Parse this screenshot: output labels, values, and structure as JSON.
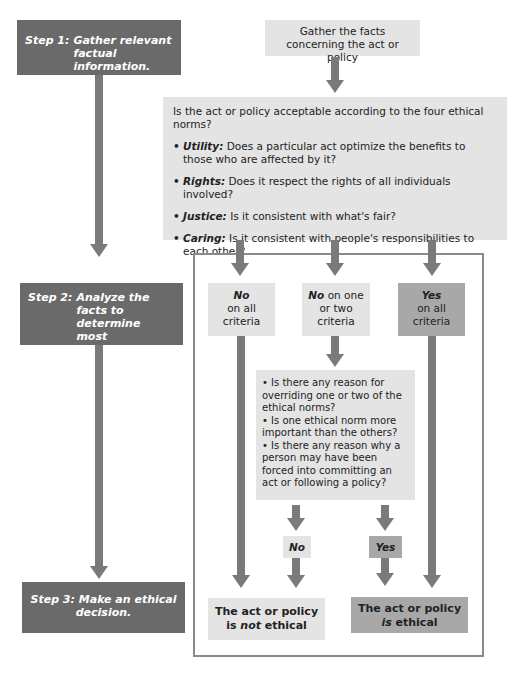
{
  "steps": [
    {
      "prefix": "Step 1:",
      "text": "Gather relevant factual information."
    },
    {
      "prefix": "Step 2:",
      "text": "Analyze the facts to determine most appropriate moral values."
    },
    {
      "prefix": "Step 3:",
      "text": "Make an ethical decision."
    }
  ],
  "gather_box": {
    "text": "Gather the facts concerning the act or policy"
  },
  "question_box": {
    "question": "Is the act or policy acceptable according to the four ethical norms?",
    "norms": [
      {
        "name": "Utility:",
        "text": "Does a particular act optimize the benefits to those who are affected by it?"
      },
      {
        "name": "Rights:",
        "text": "Does it respect the rights of all individuals involved?"
      },
      {
        "name": "Justice:",
        "text": "Is it consistent with what's fair?"
      },
      {
        "name": "Caring:",
        "text": "Is it consistent with people's responsibilities to each other?"
      }
    ]
  },
  "decisions": [
    {
      "bold": "No",
      "rest": "on all criteria"
    },
    {
      "bold": "No",
      "rest": "on one or two criteria"
    },
    {
      "bold": "Yes",
      "rest": "on all criteria"
    }
  ],
  "sub_questions": [
    "Is there any reason for overriding one or two of the ethical norms?",
    "Is one ethical norm more important than the others?",
    "Is there any reason why a person may have been forced into committing an act or following a policy?"
  ],
  "sub_answers": {
    "no": "No",
    "yes": "Yes"
  },
  "outcomes": {
    "not_ethical": {
      "line1": "The act or policy",
      "pre": "is ",
      "em": "not",
      "post": " ethical"
    },
    "ethical": {
      "line1": "The act or policy",
      "em": "is",
      "post": " ethical"
    }
  },
  "colors": {
    "step_bg": "#6a6a6a",
    "light_box": "#e4e4e4",
    "dark_box": "#a8a8a8",
    "arrow": "#7a7a7a",
    "frame": "#8a8a8a"
  }
}
